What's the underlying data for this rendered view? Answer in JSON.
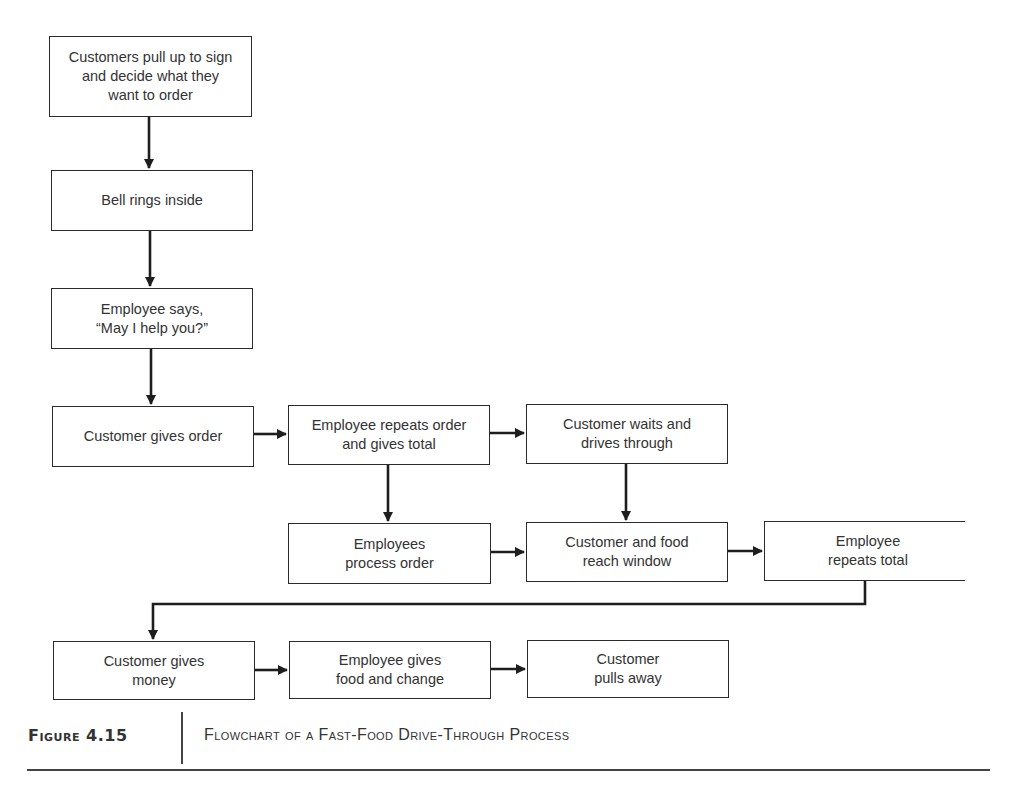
{
  "figure": {
    "label": "Figure 4.15",
    "title": "Flowchart of a Fast-Food Drive-Through Process"
  },
  "nodes": [
    {
      "id": "n1",
      "text": "Customers pull up to sign\nand decide what they\nwant to order"
    },
    {
      "id": "n2",
      "text": "Bell rings inside"
    },
    {
      "id": "n3",
      "text": "Employee says,\n“May I help you?”"
    },
    {
      "id": "n4",
      "text": "Customer gives order"
    },
    {
      "id": "n5",
      "text": "Employee repeats order\nand gives total"
    },
    {
      "id": "n6",
      "text": "Customer  waits and\ndrives through"
    },
    {
      "id": "n7",
      "text": "Employees\nprocess order"
    },
    {
      "id": "n8",
      "text": "Customer and food\nreach window"
    },
    {
      "id": "n9",
      "text": "Employee\nrepeats total"
    },
    {
      "id": "n10",
      "text": "Customer gives\nmoney"
    },
    {
      "id": "n11",
      "text": "Employee gives\nfood and change"
    },
    {
      "id": "n12",
      "text": "Customer\npulls away"
    }
  ],
  "edges": [
    {
      "from": "n1",
      "to": "n2"
    },
    {
      "from": "n2",
      "to": "n3"
    },
    {
      "from": "n3",
      "to": "n4"
    },
    {
      "from": "n4",
      "to": "n5"
    },
    {
      "from": "n5",
      "to": "n6"
    },
    {
      "from": "n5",
      "to": "n7"
    },
    {
      "from": "n6",
      "to": "n8"
    },
    {
      "from": "n7",
      "to": "n8"
    },
    {
      "from": "n8",
      "to": "n9"
    },
    {
      "from": "n9",
      "to": "n10"
    },
    {
      "from": "n10",
      "to": "n11"
    },
    {
      "from": "n11",
      "to": "n12"
    }
  ],
  "colors": {
    "line": "#1e1e1e",
    "box_border": "#2b2b2b",
    "text": "#333333",
    "background": "#ffffff"
  }
}
